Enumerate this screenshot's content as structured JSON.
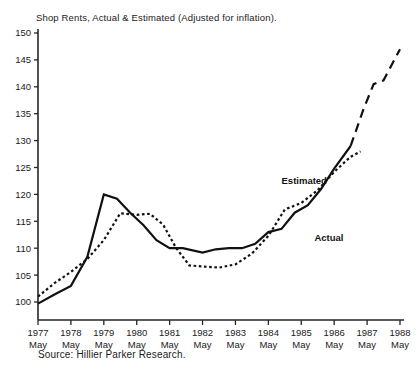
{
  "chart_data": {
    "type": "line",
    "title": "Shop Rents, Actual & Estimated (Adjusted for inflation).",
    "source": "Source: Hillier Parker Research.",
    "xlabel": "",
    "ylabel": "",
    "ylim": [
      100,
      150
    ],
    "ytick_values": [
      100,
      105,
      110,
      115,
      120,
      125,
      130,
      135,
      140,
      145,
      150
    ],
    "ytick_labels": [
      "100",
      "105",
      "110",
      "115",
      "120",
      "125",
      "130",
      "135",
      "140",
      "145",
      "150"
    ],
    "grid": false,
    "legend_position": "inline-annotations",
    "xtick_years": [
      "1977",
      "1978",
      "1979",
      "1980",
      "1981",
      "1982",
      "1983",
      "1984",
      "1985",
      "1986",
      "1987",
      "1988"
    ],
    "xtick_month": "May",
    "xlim": [
      1977,
      1988
    ],
    "annotations": [
      {
        "text": "Estimated",
        "x": 1984.4,
        "y": 122.0
      },
      {
        "text": "Actual",
        "x": 1985.4,
        "y": 111.3
      }
    ],
    "series": [
      {
        "name": "Actual",
        "style": "solid",
        "x": [
          1977.0,
          1977.5,
          1978.0,
          1978.5,
          1979.0,
          1979.4,
          1979.8,
          1980.2,
          1980.6,
          1981.0,
          1981.4,
          1982.0,
          1982.4,
          1982.8,
          1983.2,
          1983.6,
          1984.0,
          1984.4,
          1984.8,
          1985.2,
          1985.6,
          1986.0,
          1986.5
        ],
        "values": [
          99.7,
          101.4,
          103.0,
          108.4,
          120.0,
          119.2,
          116.6,
          114.3,
          111.5,
          110.0,
          110.0,
          109.2,
          109.8,
          110.0,
          110.0,
          110.8,
          113.0,
          113.6,
          116.6,
          118.0,
          121.0,
          124.8,
          129.0
        ]
      },
      {
        "name": "Estimated",
        "style": "dotted",
        "x": [
          1977.0,
          1977.5,
          1978.0,
          1978.5,
          1979.0,
          1979.5,
          1980.0,
          1980.4,
          1980.8,
          1981.2,
          1981.6,
          1982.0,
          1982.5,
          1983.0,
          1983.5,
          1984.0,
          1984.5,
          1985.0,
          1985.5,
          1986.0,
          1986.5,
          1986.8
        ],
        "values": [
          101.0,
          103.5,
          105.6,
          108.0,
          111.5,
          116.5,
          116.2,
          116.4,
          114.4,
          110.0,
          106.8,
          106.6,
          106.4,
          107.0,
          109.0,
          112.3,
          117.2,
          118.4,
          120.8,
          124.2,
          127.0,
          128.0
        ]
      },
      {
        "name": "Estimated (forecast)",
        "style": "dashed",
        "x": [
          1986.5,
          1986.9,
          1987.2,
          1987.5,
          1988.0
        ],
        "values": [
          129.0,
          136.0,
          140.5,
          141.2,
          147.0
        ]
      }
    ]
  }
}
